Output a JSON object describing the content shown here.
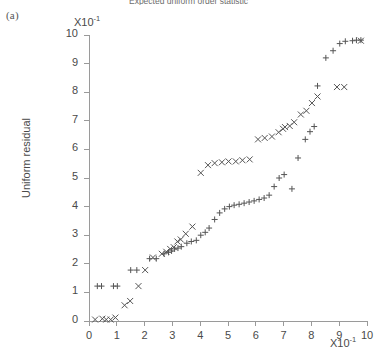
{
  "panel": {
    "label": "(a)"
  },
  "chart_data": {
    "type": "scatter",
    "title": "Expected uniform order statistic",
    "xlabel": "",
    "ylabel": "Uniform residual",
    "x_multiplier": "X10",
    "x_multiplier_exp": "-1",
    "y_multiplier": "X10",
    "y_multiplier_exp": "-1",
    "xlim": [
      0,
      10
    ],
    "ylim": [
      0,
      10
    ],
    "xticks": [
      0,
      1,
      2,
      3,
      4,
      5,
      6,
      7,
      8,
      9,
      10
    ],
    "xticklabels": [
      "0",
      "1",
      "2",
      "3",
      "4",
      "5",
      "6",
      "7",
      "8",
      "9",
      "10"
    ],
    "yticks": [
      0,
      1,
      2,
      3,
      4,
      5,
      6,
      7,
      8,
      9,
      10
    ],
    "yticklabels": [
      "0",
      "1",
      "2",
      "3",
      "4",
      "5",
      "6",
      "7",
      "8",
      "9",
      "10"
    ],
    "grid": false,
    "legend": "none",
    "marker_color": "#555555",
    "axis_color": "#9a9a9a",
    "series": [
      {
        "name": "plus-series",
        "marker": "plus",
        "points": [
          [
            0.3,
            1.22
          ],
          [
            0.45,
            1.22
          ],
          [
            0.88,
            1.22
          ],
          [
            1.02,
            1.22
          ],
          [
            1.5,
            1.78
          ],
          [
            1.72,
            1.78
          ],
          [
            2.18,
            2.18
          ],
          [
            2.42,
            2.18
          ],
          [
            2.7,
            2.35
          ],
          [
            2.86,
            2.4
          ],
          [
            2.97,
            2.45
          ],
          [
            3.08,
            2.52
          ],
          [
            3.2,
            2.55
          ],
          [
            3.32,
            2.6
          ],
          [
            3.52,
            2.72
          ],
          [
            3.68,
            2.78
          ],
          [
            3.86,
            2.82
          ],
          [
            4.02,
            3.0
          ],
          [
            4.18,
            3.1
          ],
          [
            4.32,
            3.25
          ],
          [
            4.52,
            3.55
          ],
          [
            4.7,
            3.78
          ],
          [
            4.88,
            3.92
          ],
          [
            5.05,
            4.0
          ],
          [
            5.22,
            4.05
          ],
          [
            5.4,
            4.08
          ],
          [
            5.58,
            4.12
          ],
          [
            5.76,
            4.16
          ],
          [
            5.94,
            4.2
          ],
          [
            6.12,
            4.25
          ],
          [
            6.3,
            4.3
          ],
          [
            6.48,
            4.4
          ],
          [
            6.66,
            4.7
          ],
          [
            6.84,
            5.0
          ],
          [
            7.02,
            5.12
          ],
          [
            7.3,
            4.62
          ],
          [
            7.52,
            5.7
          ],
          [
            7.78,
            6.35
          ],
          [
            7.95,
            6.62
          ],
          [
            8.1,
            6.8
          ],
          [
            8.22,
            8.22
          ],
          [
            8.52,
            9.2
          ],
          [
            8.78,
            9.45
          ],
          [
            9.02,
            9.7
          ],
          [
            9.22,
            9.78
          ],
          [
            9.48,
            9.8
          ],
          [
            9.62,
            9.82
          ],
          [
            9.78,
            9.82
          ]
        ]
      },
      {
        "name": "cross-series",
        "marker": "cross",
        "points": [
          [
            0.22,
            0.05
          ],
          [
            0.48,
            0.08
          ],
          [
            0.62,
            0.05
          ],
          [
            0.78,
            0.05
          ],
          [
            0.95,
            0.12
          ],
          [
            1.28,
            0.55
          ],
          [
            1.48,
            0.7
          ],
          [
            1.78,
            1.22
          ],
          [
            2.02,
            1.78
          ],
          [
            2.3,
            2.22
          ],
          [
            2.62,
            2.35
          ],
          [
            2.78,
            2.42
          ],
          [
            2.92,
            2.52
          ],
          [
            3.05,
            2.58
          ],
          [
            3.18,
            2.78
          ],
          [
            3.3,
            2.85
          ],
          [
            3.48,
            3.05
          ],
          [
            3.72,
            3.3
          ],
          [
            4.02,
            5.18
          ],
          [
            4.28,
            5.45
          ],
          [
            4.52,
            5.52
          ],
          [
            4.78,
            5.55
          ],
          [
            5.02,
            5.58
          ],
          [
            5.28,
            5.58
          ],
          [
            5.52,
            5.62
          ],
          [
            5.78,
            5.65
          ],
          [
            6.08,
            6.35
          ],
          [
            6.32,
            6.4
          ],
          [
            6.58,
            6.45
          ],
          [
            6.82,
            6.6
          ],
          [
            6.98,
            6.72
          ],
          [
            7.05,
            6.78
          ],
          [
            7.22,
            6.82
          ],
          [
            7.38,
            6.95
          ],
          [
            7.62,
            7.22
          ],
          [
            7.82,
            7.35
          ],
          [
            8.02,
            7.62
          ],
          [
            8.22,
            7.85
          ],
          [
            8.92,
            8.18
          ],
          [
            9.18,
            8.18
          ],
          [
            9.78,
            9.8
          ]
        ]
      }
    ]
  }
}
